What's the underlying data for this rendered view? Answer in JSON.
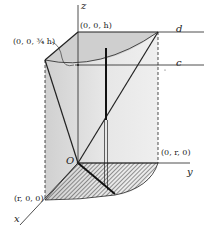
{
  "diagram": {
    "type": "3d-solid-geometry",
    "colors": {
      "background": "#ffffff",
      "solid_fill": "#d9d9d9",
      "solid_fill_light": "#ececec",
      "lines": "#222222",
      "hatch": "#333333"
    },
    "axes": {
      "z_label": "z",
      "y_label": "y",
      "x_label": "x",
      "origin_label": "O"
    },
    "points": {
      "top_z": "(0, 0, h)",
      "mid_z": "(0, 0, ¾ h)",
      "y_point": "(0, r, 0)",
      "x_point": "(r, 0, 0)"
    },
    "lines": {
      "upper": "d",
      "lower": "c"
    }
  }
}
